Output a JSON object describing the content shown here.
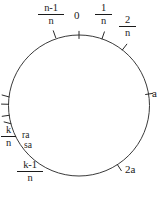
{
  "figure": {
    "type": "circle-diagram",
    "stroke_color": "#3a3a3a",
    "text_color": "#1a1a1a",
    "background": "#ffffff",
    "circle": {
      "cx": 79,
      "cy": 105.5,
      "r": 70.5
    }
  },
  "labels": {
    "n_minus_1_over_n": {
      "num": "n-1",
      "den": "n"
    },
    "zero": "0",
    "one_over_n": {
      "num": "1",
      "den": "n"
    },
    "two_over_n": {
      "num": "2",
      "den": "n"
    },
    "a": "a",
    "two_a": "2a",
    "k_over_n": {
      "num": "k",
      "den": "n"
    },
    "k_minus_1_over_n": {
      "num": "k-1",
      "den": "n"
    },
    "ra": "ra",
    "sa": "sa"
  },
  "ticks": [
    {
      "name": "tick-n-minus-1-over-n",
      "angle_deg": -109
    },
    {
      "name": "tick-zero",
      "angle_deg": -90
    },
    {
      "name": "tick-one-over-n",
      "angle_deg": -71
    },
    {
      "name": "tick-two-over-n",
      "angle_deg": -52
    },
    {
      "name": "tick-a",
      "angle_deg": -9
    },
    {
      "name": "tick-two-a",
      "angle_deg": 57
    },
    {
      "name": "tick-k-over-n",
      "angle_deg": 165
    },
    {
      "name": "tick-ra",
      "angle_deg": 172
    },
    {
      "name": "tick-sa",
      "angle_deg": 179
    },
    {
      "name": "tick-k-minus-1-over-n",
      "angle_deg": 187
    }
  ]
}
